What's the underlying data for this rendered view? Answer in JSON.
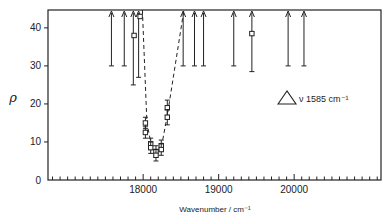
{
  "chart_data": {
    "type": "scatter",
    "title": "",
    "xlabel": "Wavenumber / cm⁻¹",
    "ylabel": "ρ",
    "xlim": [
      16740,
      21150
    ],
    "ylim": [
      0,
      44.7
    ],
    "xticks_major": [
      18000,
      19000,
      20000
    ],
    "xticks_minor_step": 100,
    "yticks": [
      0,
      10,
      20,
      30,
      40
    ],
    "grid": false,
    "legend": null,
    "annotation": {
      "symbol": "△",
      "text": "ν 1585 cm⁻¹"
    },
    "series": [
      {
        "name": "measured points",
        "marker": "open-square",
        "points": [
          {
            "x": 17880,
            "y": 38.0,
            "err": 0
          },
          {
            "x": 17960,
            "y": 43.0,
            "err": 0
          },
          {
            "x": 18030,
            "y": 15.0,
            "err": 1.5
          },
          {
            "x": 18030,
            "y": 12.5,
            "err": 1.5
          },
          {
            "x": 18100,
            "y": 9.5,
            "err": 1.5
          },
          {
            "x": 18100,
            "y": 8.5,
            "err": 1.5
          },
          {
            "x": 18170,
            "y": 7.5,
            "err": 1.5
          },
          {
            "x": 18170,
            "y": 6.5,
            "err": 1.5
          },
          {
            "x": 18240,
            "y": 9.0,
            "err": 1.5
          },
          {
            "x": 18240,
            "y": 8.0,
            "err": 1.5
          },
          {
            "x": 18320,
            "y": 19.0,
            "err": 2.0
          },
          {
            "x": 18320,
            "y": 16.5,
            "err": 2.0
          },
          {
            "x": 19440,
            "y": 38.5,
            "err": 0
          }
        ]
      },
      {
        "name": "lower limits (arrows)",
        "marker": "arrow-up",
        "points": [
          {
            "x": 17580,
            "y_from": 30,
            "y_to": 44.7
          },
          {
            "x": 17750,
            "y_from": 30,
            "y_to": 44.7
          },
          {
            "x": 17870,
            "y_from": 25,
            "y_to": 44.7
          },
          {
            "x": 17940,
            "y_from": 27,
            "y_to": 44.7
          },
          {
            "x": 18530,
            "y_from": 30,
            "y_to": 44.7
          },
          {
            "x": 18680,
            "y_from": 30,
            "y_to": 44.7
          },
          {
            "x": 18800,
            "y_from": 30,
            "y_to": 44.7
          },
          {
            "x": 19200,
            "y_from": 30,
            "y_to": 44.7
          },
          {
            "x": 19440,
            "y_from": 28.5,
            "y_to": 44.7
          },
          {
            "x": 19920,
            "y_from": 30,
            "y_to": 44.7
          },
          {
            "x": 20130,
            "y_from": 30,
            "y_to": 44.7
          }
        ]
      },
      {
        "name": "dashed guide",
        "style": "dashed",
        "x": [
          17990,
          18050,
          18110,
          18170,
          18240,
          18320,
          18540
        ],
        "y": [
          44.7,
          15,
          9,
          7,
          8.5,
          17,
          44.7
        ]
      }
    ]
  }
}
